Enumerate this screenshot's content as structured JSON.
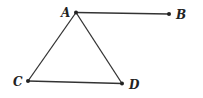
{
  "diagram": {
    "points": [
      {
        "id": "A",
        "label": "A"
      },
      {
        "id": "B",
        "label": "B"
      },
      {
        "id": "C",
        "label": "C"
      },
      {
        "id": "D",
        "label": "D"
      }
    ],
    "segments": [
      {
        "from": "A",
        "to": "B"
      },
      {
        "from": "A",
        "to": "C"
      },
      {
        "from": "A",
        "to": "D"
      },
      {
        "from": "C",
        "to": "D"
      }
    ],
    "colors": {
      "stroke": "#333333",
      "point": "#222222"
    }
  }
}
